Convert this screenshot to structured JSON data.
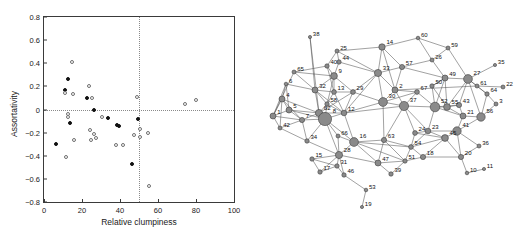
{
  "figure": {
    "panels": [
      "scatter",
      "network"
    ]
  },
  "chart_data": [
    {
      "type": "scatter",
      "panel": "left",
      "title": "",
      "xlabel": "Relative clumpiness",
      "ylabel": "Assortativity",
      "xlim": [
        0,
        100
      ],
      "ylim": [
        -0.8,
        0.8
      ],
      "xticks": [
        0,
        20,
        40,
        60,
        80,
        100
      ],
      "yticks": [
        0.8,
        0.6,
        0.4,
        0.2,
        0,
        -0.2,
        -0.4,
        -0.6,
        -0.8
      ],
      "grid": false,
      "reference_lines": [
        {
          "orient": "horizontal",
          "value": 0,
          "style": "dotted"
        },
        {
          "orient": "vertical",
          "value": 50,
          "style": "dotted"
        }
      ],
      "legend": [],
      "series": [
        {
          "name": "filled",
          "marker": "filled-circle",
          "color": "#111111",
          "points": [
            {
              "x": 6.5,
              "y": -0.3
            },
            {
              "x": 11.0,
              "y": 0.17
            },
            {
              "x": 12.5,
              "y": 0.265
            },
            {
              "x": 13.5,
              "y": -0.12
            },
            {
              "x": 22.5,
              "y": 0.1
            },
            {
              "x": 26.5,
              "y": -0.005
            },
            {
              "x": 33.5,
              "y": -0.07
            },
            {
              "x": 38.5,
              "y": -0.135
            },
            {
              "x": 39.5,
              "y": -0.14
            },
            {
              "x": 46.5,
              "y": -0.47
            },
            {
              "x": 49.5,
              "y": -0.085
            }
          ]
        },
        {
          "name": "open",
          "marker": "open-circle",
          "color": "#6f6f6f",
          "points": [
            {
              "x": 11.0,
              "y": 0.145
            },
            {
              "x": 11.5,
              "y": -0.41
            },
            {
              "x": 12.5,
              "y": -0.035
            },
            {
              "x": 12.5,
              "y": -0.065
            },
            {
              "x": 14.5,
              "y": 0.41
            },
            {
              "x": 15.5,
              "y": 0.135
            },
            {
              "x": 16.0,
              "y": -0.265
            },
            {
              "x": 23.5,
              "y": 0.205
            },
            {
              "x": 24.0,
              "y": -0.175
            },
            {
              "x": 24.5,
              "y": -0.265
            },
            {
              "x": 25.5,
              "y": 0.1
            },
            {
              "x": 26.5,
              "y": -0.215
            },
            {
              "x": 27.5,
              "y": -0.245
            },
            {
              "x": 30.5,
              "y": -0.065
            },
            {
              "x": 38.0,
              "y": -0.305
            },
            {
              "x": 41.5,
              "y": -0.305
            },
            {
              "x": 47.5,
              "y": -0.22
            },
            {
              "x": 49.0,
              "y": 0.11
            },
            {
              "x": 50.5,
              "y": -0.165
            },
            {
              "x": 50.5,
              "y": -0.24
            },
            {
              "x": 54.5,
              "y": -0.205
            },
            {
              "x": 55.5,
              "y": -0.665
            },
            {
              "x": 74.0,
              "y": 0.05
            },
            {
              "x": 80.0,
              "y": 0.08
            }
          ]
        }
      ]
    },
    {
      "type": "network",
      "panel": "right",
      "title": "",
      "node_count": 67,
      "node_labels": [
        1,
        2,
        3,
        4,
        5,
        6,
        7,
        8,
        9,
        10,
        11,
        12,
        13,
        14,
        15,
        16,
        17,
        18,
        19,
        20,
        21,
        22,
        23,
        24,
        25,
        26,
        27,
        28,
        29,
        30,
        31,
        32,
        33,
        34,
        35,
        36,
        37,
        38,
        39,
        40,
        41,
        42,
        43,
        44,
        45,
        46,
        47,
        49,
        50,
        51,
        52,
        53,
        54,
        55,
        56,
        57,
        58,
        59,
        60,
        61,
        62,
        63,
        64,
        65,
        66,
        67
      ],
      "node_color": "#8a8a8a",
      "edge_color": "#555555",
      "nodes": [
        {
          "id": 1,
          "x": 8,
          "y": 116,
          "r": 3.0
        },
        {
          "id": 38,
          "x": 45,
          "y": 37,
          "r": 1.6
        },
        {
          "id": 65,
          "x": 29,
          "y": 72,
          "r": 2.0
        },
        {
          "id": 25,
          "x": 72,
          "y": 51,
          "r": 2.0
        },
        {
          "id": 14,
          "x": 117,
          "y": 47,
          "r": 3.2
        },
        {
          "id": 40,
          "x": 62,
          "y": 66,
          "r": 2.2
        },
        {
          "id": 44,
          "x": 74,
          "y": 62,
          "r": 2.2
        },
        {
          "id": 9,
          "x": 69,
          "y": 76,
          "r": 3.4
        },
        {
          "id": 33,
          "x": 113,
          "y": 73,
          "r": 3.6
        },
        {
          "id": 6,
          "x": 21,
          "y": 84,
          "r": 1.8
        },
        {
          "id": 32,
          "x": 50,
          "y": 90,
          "r": 3.0
        },
        {
          "id": 13,
          "x": 69,
          "y": 92,
          "r": 2.4
        },
        {
          "id": 29,
          "x": 88,
          "y": 92,
          "r": 2.4
        },
        {
          "id": 2,
          "x": 130,
          "y": 90,
          "r": 3.0
        },
        {
          "id": 4,
          "x": 17,
          "y": 99,
          "r": 3.0
        },
        {
          "id": 5,
          "x": 24,
          "y": 110,
          "r": 3.0
        },
        {
          "id": 58,
          "x": 62,
          "y": 104,
          "r": 2.2
        },
        {
          "id": 62,
          "x": 54,
          "y": 113,
          "r": 3.6
        },
        {
          "id": 30,
          "x": 118,
          "y": 102,
          "r": 4.4
        },
        {
          "id": 67,
          "x": 152,
          "y": 92,
          "r": 2.4
        },
        {
          "id": 57,
          "x": 137,
          "y": 67,
          "r": 2.6
        },
        {
          "id": 26,
          "x": 167,
          "y": 60,
          "r": 2.0
        },
        {
          "id": 60,
          "x": 153,
          "y": 38,
          "r": 1.8
        },
        {
          "id": 59,
          "x": 183,
          "y": 48,
          "r": 2.0
        },
        {
          "id": 49,
          "x": 180,
          "y": 78,
          "r": 3.0
        },
        {
          "id": 27,
          "x": 203,
          "y": 79,
          "r": 4.4
        },
        {
          "id": 35,
          "x": 230,
          "y": 65,
          "r": 1.6
        },
        {
          "id": 61,
          "x": 212,
          "y": 86,
          "r": 2.0
        },
        {
          "id": 22,
          "x": 238,
          "y": 87,
          "r": 2.0
        },
        {
          "id": 50,
          "x": 167,
          "y": 86,
          "r": 2.2
        },
        {
          "id": 64,
          "x": 222,
          "y": 94,
          "r": 2.2
        },
        {
          "id": 3,
          "x": 231,
          "y": 104,
          "r": 2.0
        },
        {
          "id": 7,
          "x": 37,
          "y": 120,
          "r": 2.6
        },
        {
          "id": 8,
          "x": 60,
          "y": 119,
          "r": 6.6
        },
        {
          "id": 12,
          "x": 79,
          "y": 113,
          "r": 2.8
        },
        {
          "id": 37,
          "x": 139,
          "y": 106,
          "r": 4.6
        },
        {
          "id": 52,
          "x": 170,
          "y": 107,
          "r": 4.8
        },
        {
          "id": 55,
          "x": 182,
          "y": 107,
          "r": 3.4
        },
        {
          "id": 43,
          "x": 194,
          "y": 105,
          "r": 2.6
        },
        {
          "id": 21,
          "x": 198,
          "y": 116,
          "r": 3.0
        },
        {
          "id": 56,
          "x": 216,
          "y": 117,
          "r": 4.2
        },
        {
          "id": 42,
          "x": 15,
          "y": 128,
          "r": 2.0
        },
        {
          "id": 34,
          "x": 42,
          "y": 141,
          "r": 2.2
        },
        {
          "id": 66,
          "x": 73,
          "y": 136,
          "r": 2.0
        },
        {
          "id": 24,
          "x": 150,
          "y": 133,
          "r": 2.4
        },
        {
          "id": 23,
          "x": 163,
          "y": 131,
          "r": 2.8
        },
        {
          "id": 45,
          "x": 180,
          "y": 138,
          "r": 3.4
        },
        {
          "id": 41,
          "x": 192,
          "y": 131,
          "r": 4.2
        },
        {
          "id": 16,
          "x": 89,
          "y": 142,
          "r": 4.4
        },
        {
          "id": 63,
          "x": 119,
          "y": 140,
          "r": 2.6
        },
        {
          "id": 54,
          "x": 146,
          "y": 147,
          "r": 2.4
        },
        {
          "id": 36,
          "x": 214,
          "y": 146,
          "r": 2.0
        },
        {
          "id": 20,
          "x": 196,
          "y": 157,
          "r": 2.6
        },
        {
          "id": 18,
          "x": 158,
          "y": 157,
          "r": 2.6
        },
        {
          "id": 51,
          "x": 140,
          "y": 161,
          "r": 2.2
        },
        {
          "id": 11,
          "x": 219,
          "y": 169,
          "r": 1.6
        },
        {
          "id": 10,
          "x": 202,
          "y": 173,
          "r": 1.8
        },
        {
          "id": 15,
          "x": 47,
          "y": 159,
          "r": 2.2
        },
        {
          "id": 28,
          "x": 74,
          "y": 155,
          "r": 3.6
        },
        {
          "id": 31,
          "x": 72,
          "y": 166,
          "r": 2.2
        },
        {
          "id": 17,
          "x": 55,
          "y": 172,
          "r": 2.2
        },
        {
          "id": 46,
          "x": 79,
          "y": 175,
          "r": 2.2
        },
        {
          "id": 47,
          "x": 113,
          "y": 163,
          "r": 3.0
        },
        {
          "id": 39,
          "x": 126,
          "y": 174,
          "r": 2.2
        },
        {
          "id": 53,
          "x": 101,
          "y": 190,
          "r": 1.8
        },
        {
          "id": 19,
          "x": 97,
          "y": 207,
          "r": 1.6
        }
      ],
      "edges": [
        [
          1,
          4
        ],
        [
          1,
          5
        ],
        [
          1,
          65
        ],
        [
          1,
          6
        ],
        [
          1,
          42
        ],
        [
          1,
          7
        ],
        [
          38,
          32
        ],
        [
          38,
          62
        ],
        [
          65,
          9
        ],
        [
          65,
          32
        ],
        [
          65,
          40
        ],
        [
          25,
          40
        ],
        [
          25,
          44
        ],
        [
          25,
          33
        ],
        [
          25,
          14
        ],
        [
          14,
          33
        ],
        [
          14,
          2
        ],
        [
          14,
          57
        ],
        [
          14,
          60
        ],
        [
          40,
          9
        ],
        [
          40,
          13
        ],
        [
          44,
          9
        ],
        [
          44,
          33
        ],
        [
          9,
          13
        ],
        [
          9,
          32
        ],
        [
          9,
          29
        ],
        [
          9,
          58
        ],
        [
          33,
          29
        ],
        [
          33,
          2
        ],
        [
          33,
          30
        ],
        [
          33,
          57
        ],
        [
          33,
          12
        ],
        [
          6,
          32
        ],
        [
          6,
          4
        ],
        [
          6,
          5
        ],
        [
          32,
          13
        ],
        [
          32,
          62
        ],
        [
          32,
          58
        ],
        [
          32,
          12
        ],
        [
          13,
          29
        ],
        [
          13,
          58
        ],
        [
          13,
          12
        ],
        [
          29,
          30
        ],
        [
          29,
          12
        ],
        [
          29,
          62
        ],
        [
          2,
          30
        ],
        [
          2,
          67
        ],
        [
          2,
          37
        ],
        [
          2,
          57
        ],
        [
          2,
          61
        ],
        [
          4,
          5
        ],
        [
          4,
          7
        ],
        [
          4,
          42
        ],
        [
          4,
          62
        ],
        [
          5,
          7
        ],
        [
          5,
          62
        ],
        [
          5,
          8
        ],
        [
          58,
          62
        ],
        [
          58,
          12
        ],
        [
          58,
          8
        ],
        [
          62,
          8
        ],
        [
          62,
          12
        ],
        [
          62,
          7
        ],
        [
          30,
          37
        ],
        [
          30,
          67
        ],
        [
          30,
          12
        ],
        [
          30,
          63
        ],
        [
          67,
          37
        ],
        [
          67,
          52
        ],
        [
          57,
          26
        ],
        [
          57,
          49
        ],
        [
          26,
          59
        ],
        [
          26,
          49
        ],
        [
          60,
          59
        ],
        [
          60,
          26
        ],
        [
          59,
          27
        ],
        [
          49,
          27
        ],
        [
          49,
          50
        ],
        [
          49,
          52
        ],
        [
          49,
          55
        ],
        [
          27,
          61
        ],
        [
          27,
          64
        ],
        [
          27,
          35
        ],
        [
          27,
          55
        ],
        [
          27,
          43
        ],
        [
          27,
          56
        ],
        [
          61,
          64
        ],
        [
          61,
          22
        ],
        [
          64,
          3
        ],
        [
          64,
          56
        ],
        [
          3,
          56
        ],
        [
          50,
          52
        ],
        [
          50,
          55
        ],
        [
          50,
          49
        ],
        [
          7,
          8
        ],
        [
          7,
          34
        ],
        [
          7,
          42
        ],
        [
          8,
          12
        ],
        [
          8,
          66
        ],
        [
          8,
          16
        ],
        [
          8,
          34
        ],
        [
          8,
          28
        ],
        [
          12,
          16
        ],
        [
          12,
          37
        ],
        [
          37,
          52
        ],
        [
          37,
          24
        ],
        [
          37,
          23
        ],
        [
          37,
          63
        ],
        [
          52,
          55
        ],
        [
          52,
          43
        ],
        [
          52,
          21
        ],
        [
          52,
          23
        ],
        [
          55,
          43
        ],
        [
          55,
          21
        ],
        [
          43,
          21
        ],
        [
          21,
          56
        ],
        [
          21,
          41
        ],
        [
          41,
          45
        ],
        [
          41,
          23
        ],
        [
          41,
          20
        ],
        [
          41,
          36
        ],
        [
          41,
          56
        ],
        [
          24,
          23
        ],
        [
          24,
          45
        ],
        [
          24,
          54
        ],
        [
          23,
          45
        ],
        [
          23,
          54
        ],
        [
          45,
          54
        ],
        [
          45,
          18
        ],
        [
          45,
          20
        ],
        [
          16,
          28
        ],
        [
          16,
          63
        ],
        [
          16,
          66
        ],
        [
          16,
          47
        ],
        [
          16,
          54
        ],
        [
          63,
          54
        ],
        [
          63,
          47
        ],
        [
          63,
          51
        ],
        [
          54,
          51
        ],
        [
          54,
          18
        ],
        [
          18,
          20
        ],
        [
          20,
          10
        ],
        [
          20,
          36
        ],
        [
          10,
          11
        ],
        [
          28,
          15
        ],
        [
          28,
          31
        ],
        [
          28,
          17
        ],
        [
          28,
          46
        ],
        [
          28,
          47
        ],
        [
          28,
          66
        ],
        [
          15,
          17
        ],
        [
          15,
          31
        ],
        [
          31,
          17
        ],
        [
          31,
          46
        ],
        [
          46,
          53
        ],
        [
          53,
          19
        ],
        [
          47,
          39
        ],
        [
          47,
          51
        ],
        [
          39,
          51
        ],
        [
          34,
          28
        ],
        [
          42,
          34
        ],
        [
          51,
          18
        ],
        [
          16,
          51
        ]
      ]
    }
  ]
}
